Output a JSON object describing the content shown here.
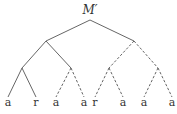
{
  "diagram": {
    "type": "tree",
    "root": {
      "label": "M′",
      "x": 90,
      "y": 20,
      "label_y": 14
    },
    "nodes": [
      {
        "id": "root",
        "x": 90,
        "y": 20
      },
      {
        "id": "L",
        "x": 46,
        "y": 41
      },
      {
        "id": "R",
        "x": 134,
        "y": 41
      },
      {
        "id": "LL",
        "x": 22,
        "y": 68
      },
      {
        "id": "LR",
        "x": 71,
        "y": 68
      },
      {
        "id": "RL",
        "x": 109,
        "y": 68
      },
      {
        "id": "RR",
        "x": 158,
        "y": 68
      }
    ],
    "leaves": [
      {
        "label": "a",
        "x": 8,
        "y": 97
      },
      {
        "label": "r",
        "x": 36,
        "y": 97
      },
      {
        "label": "a",
        "x": 56,
        "y": 97
      },
      {
        "label": "a",
        "x": 84,
        "y": 97
      },
      {
        "label": "r",
        "x": 95,
        "y": 97
      },
      {
        "label": "a",
        "x": 123,
        "y": 97
      },
      {
        "label": "a",
        "x": 144,
        "y": 97
      },
      {
        "label": "a",
        "x": 172,
        "y": 97
      }
    ],
    "edges": [
      {
        "from": [
          90,
          20
        ],
        "to": [
          46,
          41
        ],
        "style": "solid"
      },
      {
        "from": [
          90,
          20
        ],
        "to": [
          134,
          41
        ],
        "style": "solid"
      },
      {
        "from": [
          46,
          41
        ],
        "to": [
          22,
          68
        ],
        "style": "solid"
      },
      {
        "from": [
          46,
          41
        ],
        "to": [
          71,
          68
        ],
        "style": "solid"
      },
      {
        "from": [
          134,
          41
        ],
        "to": [
          109,
          68
        ],
        "style": "dashed"
      },
      {
        "from": [
          134,
          41
        ],
        "to": [
          158,
          68
        ],
        "style": "dashed"
      },
      {
        "from": [
          22,
          68
        ],
        "to": [
          8,
          97
        ],
        "style": "solid"
      },
      {
        "from": [
          22,
          68
        ],
        "to": [
          36,
          97
        ],
        "style": "solid"
      },
      {
        "from": [
          71,
          68
        ],
        "to": [
          56,
          97
        ],
        "style": "dashed"
      },
      {
        "from": [
          71,
          68
        ],
        "to": [
          84,
          97
        ],
        "style": "dashed"
      },
      {
        "from": [
          109,
          68
        ],
        "to": [
          95,
          97
        ],
        "style": "dashed"
      },
      {
        "from": [
          109,
          68
        ],
        "to": [
          123,
          97
        ],
        "style": "dashed"
      },
      {
        "from": [
          158,
          68
        ],
        "to": [
          144,
          97
        ],
        "style": "dashed"
      },
      {
        "from": [
          158,
          68
        ],
        "to": [
          172,
          97
        ],
        "style": "dashed"
      }
    ],
    "leaf_label_y": 106,
    "colors": {
      "line": "#555555",
      "text": "#333333",
      "background": "#ffffff"
    }
  }
}
